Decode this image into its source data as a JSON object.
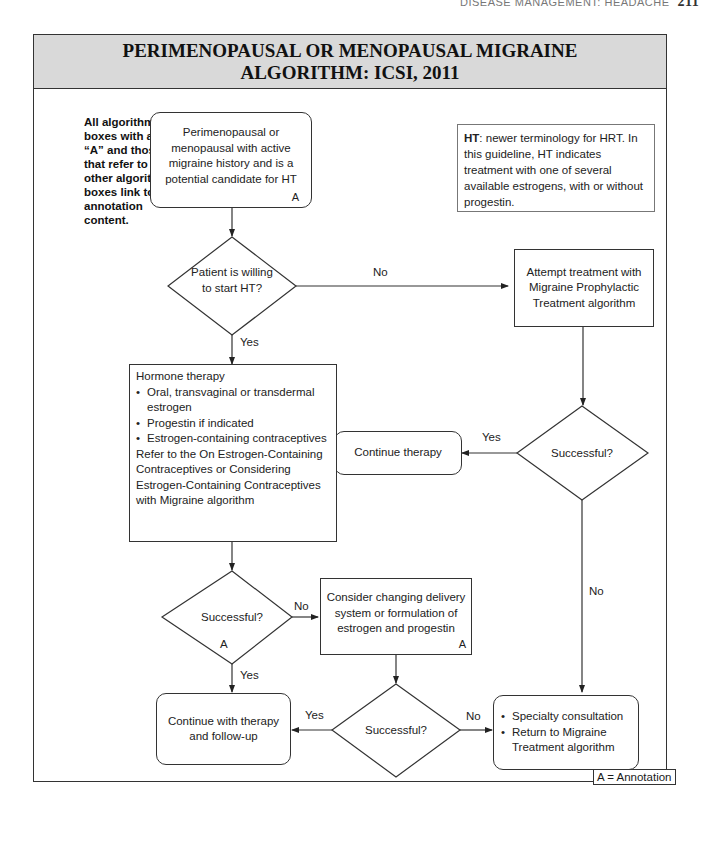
{
  "running_head": {
    "text": "DISEASE MANAGEMENT: HEADACHE",
    "page": "211"
  },
  "title": {
    "line1": "PERIMENOPAUSAL OR MENOPAUSAL MIGRAINE",
    "line2": "ALGORITHM: ICSI, 2011"
  },
  "side_note": "All algorithm boxes with an “A” and those that refer to other algorithm boxes link to annotation content.",
  "ht_note": {
    "term": "HT",
    "text": ": newer terminology for HRT. In this guideline, HT indicates treatment with one of several available estrogens, with or without progestin."
  },
  "nodes": {
    "start": {
      "text": "Perimenopausal or menopausal with active migraine history and is a potential candidate for HT",
      "annotation": "A"
    },
    "willing": {
      "text": "Patient is willing to start HT?"
    },
    "prophylactic": {
      "text": "Attempt treatment with Migraine Prophylactic Treatment algorithm"
    },
    "success_right": {
      "text": "Successful?"
    },
    "continue_therapy": {
      "text": "Continue therapy"
    },
    "hormone": {
      "heading": "Hormone therapy",
      "bullets": [
        "Oral, transvaginal or transdermal estrogen",
        "Progestin if indicated",
        "Estrogen-containing contraceptives"
      ],
      "footer": "Refer to the On Estrogen-Containing Contraceptives or Considering Estrogen-Containing Contraceptives with Migraine algorithm"
    },
    "success_left": {
      "text": "Successful?",
      "annotation": "A"
    },
    "consider": {
      "text": "Consider changing delivery system or formulation of estrogen and progestin",
      "annotation": "A"
    },
    "success_mid": {
      "text": "Successful?"
    },
    "continue_followup": {
      "text": "Continue with therapy and follow-up"
    },
    "specialty": {
      "bullets": [
        "Specialty consultation",
        "Return to Migraine Treatment algorithm"
      ]
    }
  },
  "edge_labels": {
    "willing_no": "No",
    "willing_yes": "Yes",
    "right_yes": "Yes",
    "right_no": "No",
    "left_no": "No",
    "left_yes": "Yes",
    "mid_yes": "Yes",
    "mid_no": "No"
  },
  "legend": "A = Annotation"
}
